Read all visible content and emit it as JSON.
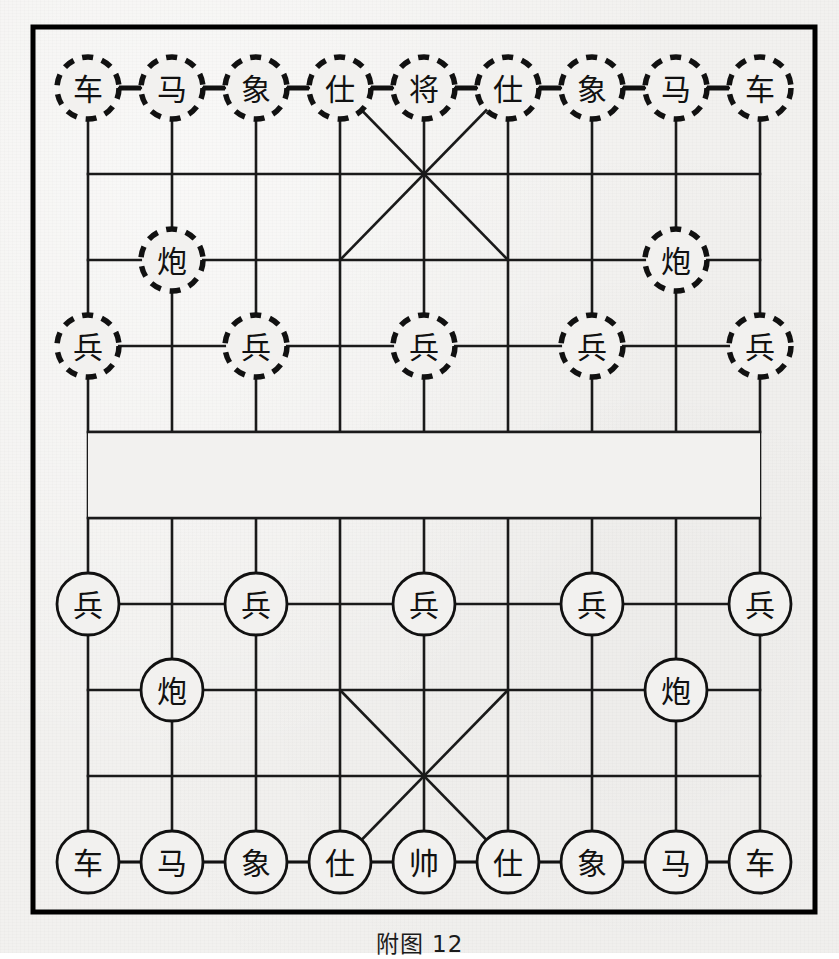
{
  "caption": "附图 12",
  "board": {
    "title": "Xiangqi board diagram",
    "files": 9,
    "ranks": 10,
    "geometry": {
      "border_left": 33,
      "border_top": 27,
      "border_right": 815,
      "border_bottom": 912,
      "grid_left": 88,
      "grid_right": 760,
      "grid_top": 88,
      "grid_bottom": 862,
      "file_step": 84,
      "rank_step": 86,
      "river_top": 432,
      "river_bottom": 518,
      "piece_radius": 31
    },
    "colors": {
      "paper": "#f2f1ef",
      "ink": "#111111",
      "grid_line": "#1a1a1a",
      "border": "#000000",
      "piece_fill": "#f2f1ef"
    },
    "river": {
      "has_text": false,
      "label": ""
    },
    "palaces": [
      {
        "name": "black-palace",
        "top_rank": 0,
        "bottom_rank": 2,
        "left_file": 3,
        "right_file": 5
      },
      {
        "name": "red-palace",
        "top_rank": 7,
        "bottom_rank": 9,
        "left_file": 3,
        "right_file": 5
      }
    ]
  },
  "pieces": {
    "black": {
      "side_name": "black",
      "circle_style": "dashed",
      "items": [
        {
          "label": "车",
          "name": "chariot",
          "file": 0,
          "rank": 0
        },
        {
          "label": "马",
          "name": "horse",
          "file": 1,
          "rank": 0
        },
        {
          "label": "象",
          "name": "elephant",
          "file": 2,
          "rank": 0
        },
        {
          "label": "仕",
          "name": "advisor",
          "file": 3,
          "rank": 0
        },
        {
          "label": "将",
          "name": "general",
          "file": 4,
          "rank": 0
        },
        {
          "label": "仕",
          "name": "advisor",
          "file": 5,
          "rank": 0
        },
        {
          "label": "象",
          "name": "elephant",
          "file": 6,
          "rank": 0
        },
        {
          "label": "马",
          "name": "horse",
          "file": 7,
          "rank": 0
        },
        {
          "label": "车",
          "name": "chariot",
          "file": 8,
          "rank": 0
        },
        {
          "label": "炮",
          "name": "cannon",
          "file": 1,
          "rank": 2
        },
        {
          "label": "炮",
          "name": "cannon",
          "file": 7,
          "rank": 2
        },
        {
          "label": "兵",
          "name": "pawn",
          "file": 0,
          "rank": 3
        },
        {
          "label": "兵",
          "name": "pawn",
          "file": 2,
          "rank": 3
        },
        {
          "label": "兵",
          "name": "pawn",
          "file": 4,
          "rank": 3
        },
        {
          "label": "兵",
          "name": "pawn",
          "file": 6,
          "rank": 3
        },
        {
          "label": "兵",
          "name": "pawn",
          "file": 8,
          "rank": 3
        }
      ]
    },
    "red": {
      "side_name": "red",
      "circle_style": "solid",
      "items": [
        {
          "label": "兵",
          "name": "pawn",
          "file": 0,
          "rank": 6
        },
        {
          "label": "兵",
          "name": "pawn",
          "file": 2,
          "rank": 6
        },
        {
          "label": "兵",
          "name": "pawn",
          "file": 4,
          "rank": 6
        },
        {
          "label": "兵",
          "name": "pawn",
          "file": 6,
          "rank": 6
        },
        {
          "label": "兵",
          "name": "pawn",
          "file": 8,
          "rank": 6
        },
        {
          "label": "炮",
          "name": "cannon",
          "file": 1,
          "rank": 7
        },
        {
          "label": "炮",
          "name": "cannon",
          "file": 7,
          "rank": 7
        },
        {
          "label": "车",
          "name": "chariot",
          "file": 0,
          "rank": 9
        },
        {
          "label": "马",
          "name": "horse",
          "file": 1,
          "rank": 9
        },
        {
          "label": "象",
          "name": "elephant",
          "file": 2,
          "rank": 9
        },
        {
          "label": "仕",
          "name": "advisor",
          "file": 3,
          "rank": 9
        },
        {
          "label": "帅",
          "name": "general",
          "file": 4,
          "rank": 9
        },
        {
          "label": "仕",
          "name": "advisor",
          "file": 5,
          "rank": 9
        },
        {
          "label": "象",
          "name": "elephant",
          "file": 6,
          "rank": 9
        },
        {
          "label": "马",
          "name": "horse",
          "file": 7,
          "rank": 9
        },
        {
          "label": "车",
          "name": "chariot",
          "file": 8,
          "rank": 9
        }
      ]
    }
  }
}
